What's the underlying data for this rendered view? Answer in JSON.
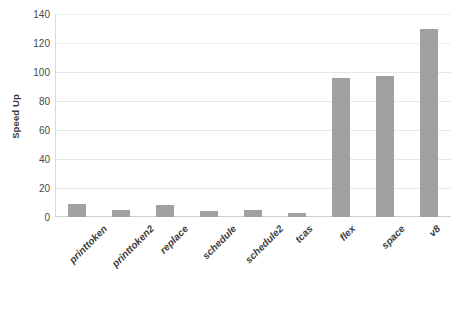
{
  "chart_data": {
    "type": "bar",
    "title": "",
    "xlabel": "",
    "ylabel": "Speed Up",
    "ylim": [
      0,
      140
    ],
    "ytick_step": 20,
    "yticks": [
      0,
      20,
      40,
      60,
      80,
      100,
      120,
      140
    ],
    "grid": true,
    "legend": false,
    "bar_color": "#a0a0a0",
    "categories": [
      "printtoken",
      "printtoken2",
      "replace",
      "schedule",
      "schedule2",
      "tcas",
      "flex",
      "space",
      "v8"
    ],
    "values": [
      9,
      5,
      8,
      4,
      5,
      3,
      96,
      97,
      130
    ]
  },
  "axes": {
    "y_title": "Speed Up",
    "y_tick_labels": [
      "140",
      "120",
      "100",
      "80",
      "60",
      "40",
      "20",
      "0"
    ]
  }
}
